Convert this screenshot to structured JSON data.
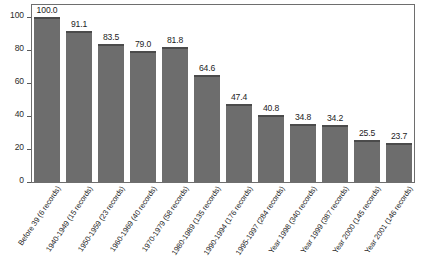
{
  "chart_data": {
    "type": "bar",
    "title": "",
    "xlabel": "",
    "ylabel": "",
    "ylim": [
      0,
      107
    ],
    "grid": false,
    "legend": "none",
    "y_ticks": [
      0,
      20,
      40,
      60,
      80,
      100
    ],
    "y_tick_labels": [
      "0",
      "20",
      "40",
      "60",
      "80",
      "100"
    ],
    "categories": [
      "Before 39 (6 records)",
      "1940-1949 (15 records)",
      "1950-1959 (23 records)",
      "1960-1969 (40 records)",
      "1970-1979 (58 records)",
      "1980-1989 (135 records)",
      "1990-1994 (176 records)",
      "1995-1997 (284 records)",
      "Year 1998 (340 records)",
      "Year 1999 (387 records)",
      "Year 2000 (145 records)",
      "Year 2001 (146 records)"
    ],
    "values": [
      100.0,
      91.1,
      83.5,
      79.0,
      81.8,
      64.6,
      47.4,
      40.8,
      34.8,
      34.2,
      25.5,
      23.7
    ],
    "value_labels": [
      "100.0",
      "91.1",
      "83.5",
      "79.0",
      "81.8",
      "64.6",
      "47.4",
      "40.8",
      "34.8",
      "34.2",
      "25.5",
      "23.7"
    ],
    "colors": {
      "bar_fill": "#6d6d6d",
      "bar_top_edge": "#4b4b4b",
      "frame": "#6e6e6e",
      "text": "#1d1d1d",
      "background": "#ffffff"
    }
  }
}
